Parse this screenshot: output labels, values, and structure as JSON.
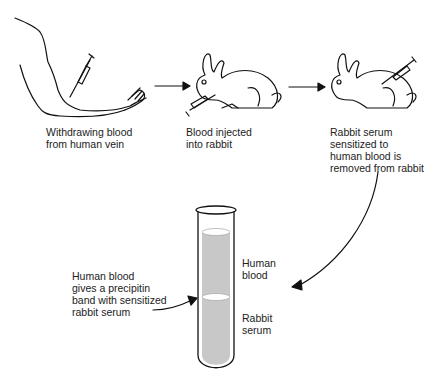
{
  "diagram": {
    "steps": [
      {
        "id": "withdraw",
        "label": "Withdrawing blood\nfrom human vein",
        "icon": "arm-with-syringe"
      },
      {
        "id": "inject",
        "label": "Blood injected\ninto rabbit",
        "icon": "rabbit-with-syringe"
      },
      {
        "id": "remove",
        "label": "Rabbit serum\nsensitized to\nhuman blood is\nremoved from rabbit",
        "icon": "rabbit-with-syringe"
      }
    ],
    "tube": {
      "upper_layer": "Human\nblood",
      "lower_layer": "Rabbit\nserum",
      "band_annotation": "Human blood\ngives a precipitin\nband with sensitized\nrabbit serum",
      "fill_color": "#c8c8c8"
    },
    "arrows": [
      "arm-to-rabbit",
      "rabbit-to-rabbit",
      "rabbit-to-tube",
      "annotation-to-band"
    ]
  }
}
